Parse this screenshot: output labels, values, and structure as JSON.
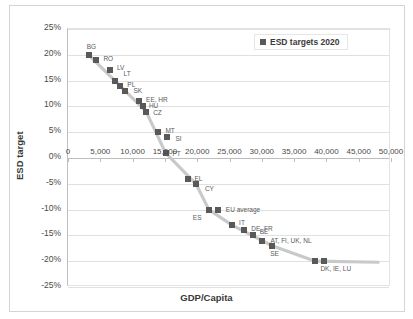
{
  "chart_data": {
    "type": "scatter",
    "title": "",
    "xlabel": "GDP/Capita",
    "ylabel": "ESD target",
    "xlim": [
      0,
      50000
    ],
    "ylim": [
      -25,
      25
    ],
    "grid": true,
    "legend_position": "top-right",
    "legend": [
      "ESD targets 2020"
    ],
    "x_ticks": [
      "0",
      "5,000",
      "10,000",
      "15,000",
      "20,000",
      "25,000",
      "30,000",
      "35,000",
      "40,000",
      "45,000",
      "50,000"
    ],
    "x_tick_values": [
      0,
      5000,
      10000,
      15000,
      20000,
      25000,
      30000,
      35000,
      40000,
      45000,
      50000
    ],
    "y_ticks": [
      "25%",
      "20%",
      "15%",
      "10%",
      "5%",
      "0%",
      "-5%",
      "-10%",
      "-15%",
      "-20%",
      "-25%"
    ],
    "y_tick_values": [
      25,
      20,
      15,
      10,
      5,
      0,
      -5,
      -10,
      -15,
      -20,
      -25
    ],
    "series": [
      {
        "name": "ESD targets 2020",
        "color": "#595959",
        "points": [
          {
            "label": "BG",
            "x": 3200,
            "y": 20.0,
            "label_dx": -2,
            "label_dy": -9
          },
          {
            "label": "RO",
            "x": 4400,
            "y": 19.0,
            "label_dx": 7,
            "label_dy": -2
          },
          {
            "label": "LV",
            "x": 6500,
            "y": 17.0,
            "label_dx": 7,
            "label_dy": -3
          },
          {
            "label": "LT",
            "x": 7200,
            "y": 15.0,
            "label_dx": 9,
            "label_dy": -8
          },
          {
            "label": "PL",
            "x": 8100,
            "y": 14.0,
            "label_dx": 7,
            "label_dy": -2
          },
          {
            "label": "SK",
            "x": 8900,
            "y": 13.0,
            "label_dx": 8,
            "label_dy": -1
          },
          {
            "label": "EE, HR",
            "x": 11000,
            "y": 11.0,
            "label_dx": 7,
            "label_dy": -2
          },
          {
            "label": "HU",
            "x": 11600,
            "y": 10.0,
            "label_dx": 6,
            "label_dy": -1
          },
          {
            "label": "CZ",
            "x": 12100,
            "y": 9.0,
            "label_dx": 7,
            "label_dy": 0
          },
          {
            "label": "MT",
            "x": 14000,
            "y": 5.0,
            "label_dx": 7,
            "label_dy": -2
          },
          {
            "label": "SI",
            "x": 15400,
            "y": 4.0,
            "label_dx": 8,
            "label_dy": 1
          },
          {
            "label": "PT",
            "x": 15100,
            "y": 1.0,
            "label_dx": 7,
            "label_dy": 0
          },
          {
            "label": "EL",
            "x": 18500,
            "y": -4.0,
            "label_dx": 7,
            "label_dy": -1
          },
          {
            "label": "CY",
            "x": 19800,
            "y": -5.0,
            "label_dx": 9,
            "label_dy": 4
          },
          {
            "label": "ES",
            "x": 21800,
            "y": -10.0,
            "label_dx": -16,
            "label_dy": 7
          },
          {
            "label": "EU average",
            "x": 23200,
            "y": -10.0,
            "label_dx": 8,
            "label_dy": -1
          },
          {
            "label": "IT",
            "x": 25400,
            "y": -13.0,
            "label_dx": 7,
            "label_dy": -3
          },
          {
            "label": "DE, FR",
            "x": 27300,
            "y": -14.0,
            "label_dx": 7,
            "label_dy": -2
          },
          {
            "label": "BE",
            "x": 28600,
            "y": -15.0,
            "label_dx": 7,
            "label_dy": -4
          },
          {
            "label": "AT, FI, UK, NL",
            "x": 30100,
            "y": -16.0,
            "label_dx": 8,
            "label_dy": -1
          },
          {
            "label": "SE",
            "x": 31600,
            "y": -17.0,
            "label_dx": -2,
            "label_dy": 7
          },
          {
            "label": "DK, IE, LU",
            "x": 38300,
            "y": -20.0,
            "label_dx": 5,
            "label_dy": 7
          },
          {
            "label": "",
            "x": 39700,
            "y": -20.0,
            "label_dx": 0,
            "label_dy": 0
          }
        ],
        "trend_path": [
          {
            "x": 3200,
            "y": 20.0
          },
          {
            "x": 12100,
            "y": 9.0
          },
          {
            "x": 15100,
            "y": 1.0
          },
          {
            "x": 19800,
            "y": -5.0
          },
          {
            "x": 21800,
            "y": -10.0
          },
          {
            "x": 25400,
            "y": -13.0
          },
          {
            "x": 31600,
            "y": -17.0
          },
          {
            "x": 38300,
            "y": -20.0
          },
          {
            "x": 48000,
            "y": -20.2
          }
        ]
      }
    ]
  }
}
